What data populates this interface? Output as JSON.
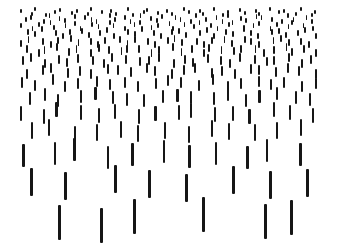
{
  "figure": {
    "background": "#ffffff",
    "stroke_color": "#161616",
    "width": 338,
    "height": 252,
    "rows": [
      {
        "y": 9,
        "h": 4,
        "w": 1.5,
        "x0": 20,
        "pitch": 8.0,
        "count": 38,
        "jx": [
          0,
          3,
          -2,
          1,
          2,
          -1,
          3
        ],
        "jy": [
          0,
          3,
          -2,
          4,
          1,
          -1,
          2,
          0,
          3,
          -2,
          1
        ]
      },
      {
        "y": 15,
        "h": 5,
        "w": 1.5,
        "x0": 24,
        "pitch": 8.2,
        "count": 36,
        "jx": [
          1,
          -2,
          3,
          0,
          2,
          -1,
          1,
          3
        ],
        "jy": [
          2,
          0,
          4,
          -2,
          1,
          3,
          -1,
          0,
          2,
          4,
          -2
        ]
      },
      {
        "y": 22,
        "h": 5,
        "w": 1.6,
        "x0": 21,
        "pitch": 8.5,
        "count": 35,
        "jx": [
          -1,
          2,
          0,
          3,
          -2,
          1,
          2
        ],
        "jy": [
          1,
          4,
          0,
          -2,
          3,
          1,
          -1,
          4,
          0,
          2,
          -2
        ]
      },
      {
        "y": 29,
        "h": 6,
        "w": 1.7,
        "x0": 25,
        "pitch": 9.0,
        "count": 33,
        "jx": [
          2,
          0,
          -2,
          3,
          1,
          -1,
          2,
          0
        ],
        "jy": [
          0,
          2,
          -3,
          1,
          4,
          0,
          -1,
          3,
          1,
          -2,
          4
        ]
      },
      {
        "y": 37,
        "h": 7,
        "w": 1.8,
        "x0": 20,
        "pitch": 9.6,
        "count": 31,
        "jx": [
          0,
          -2,
          3,
          1,
          -1,
          2,
          0,
          3
        ],
        "jy": [
          3,
          -1,
          1,
          4,
          0,
          -2,
          2,
          1,
          4,
          0,
          -1
        ]
      },
      {
        "y": 45,
        "h": 8,
        "w": 1.8,
        "x0": 25,
        "pitch": 10.3,
        "count": 29,
        "jx": [
          1,
          3,
          -2,
          0,
          2,
          -1,
          3,
          1
        ],
        "jy": [
          0,
          4,
          1,
          -2,
          3,
          0,
          4,
          -1,
          1,
          2,
          0
        ]
      },
      {
        "y": 55,
        "h": 9,
        "w": 2.0,
        "x0": 20,
        "pitch": 11.6,
        "count": 26,
        "jx": [
          2,
          -2,
          1,
          3,
          0,
          -1,
          2
        ],
        "jy": [
          1,
          -2,
          4,
          0,
          3,
          -1,
          1,
          4,
          -2,
          0,
          2
        ]
      },
      {
        "y": 65,
        "h": 10,
        "w": 2.0,
        "x0": 26,
        "pitch": 13.0,
        "count": 23,
        "jx": [
          0,
          3,
          -2,
          2,
          1,
          -1,
          3,
          0
        ],
        "jy": [
          4,
          0,
          -2,
          3,
          1,
          4,
          -1,
          0,
          2,
          -2,
          1
        ]
      },
      {
        "y": 77,
        "h": 11,
        "w": 2.1,
        "x0": 20,
        "pitch": 14.7,
        "count": 21,
        "jx": [
          1,
          -1,
          3,
          0,
          -2,
          2,
          1
        ],
        "jy": [
          0,
          3,
          -3,
          4,
          1,
          -1,
          2,
          0,
          4,
          1,
          -2
        ]
      },
      {
        "y": 90,
        "h": 13,
        "w": 2.2,
        "x0": 27,
        "pitch": 16.6,
        "count": 18,
        "jx": [
          2,
          0,
          -3,
          3,
          1,
          2,
          -1,
          0
        ],
        "jy": [
          2,
          -2,
          4,
          0,
          -3,
          1,
          3,
          4,
          0,
          -1,
          1
        ]
      },
      {
        "y": 105,
        "h": 15,
        "w": 2.2,
        "x0": 20,
        "pitch": 19.2,
        "count": 16,
        "jx": [
          0,
          4,
          -3,
          2,
          1,
          -2,
          3
        ],
        "jy": [
          1,
          4,
          -3,
          0,
          3,
          -1,
          4,
          1,
          0,
          -2,
          2
        ]
      },
      {
        "y": 122,
        "h": 17,
        "w": 2.4,
        "x0": 28,
        "pitch": 22.5,
        "count": 13,
        "jx": [
          3,
          -3,
          1,
          0,
          2,
          -4,
          1,
          2
        ],
        "jy": [
          0,
          -3,
          4,
          2,
          -1,
          3,
          0,
          4,
          -2,
          1,
          2
        ]
      },
      {
        "y": 142,
        "h": 23,
        "w": 2.6,
        "x0": 22,
        "pitch": 27.5,
        "count": 11,
        "jx": [
          0,
          4,
          -4,
          2,
          -1,
          3,
          1
        ],
        "jy": [
          2,
          0,
          -4,
          4,
          1,
          -2,
          3,
          0,
          4,
          -3,
          1
        ]
      },
      {
        "y": 168,
        "h": 28,
        "w": 2.8,
        "x0": 28,
        "pitch": 40.0,
        "count": 8,
        "jx": [
          2,
          -4,
          6,
          0,
          -3,
          4,
          1,
          -2
        ],
        "jy": [
          0,
          4,
          -3,
          2,
          6,
          -2,
          3,
          1
        ]
      },
      {
        "y": 203,
        "h": 35,
        "w": 3.0,
        "xs": [
          58,
          100,
          133,
          202,
          264,
          290
        ],
        "jy": [
          2,
          5,
          -4,
          -6,
          1,
          -3
        ]
      }
    ]
  }
}
